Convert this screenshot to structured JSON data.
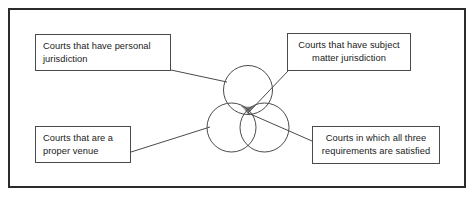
{
  "figure": {
    "frame": {
      "border_color": "#2b2b2b",
      "background_color": "#ffffff"
    },
    "venn": {
      "circle_stroke_color": "#4a4a4a",
      "circle_fill": "none",
      "intersection_fill_color": "#808080",
      "circles": [
        {
          "id": "personal-jurisdiction-circle",
          "label": "Courts that have personal jurisdiction",
          "cx": 248,
          "cy": 90,
          "r": 24.5
        },
        {
          "id": "proper-venue-circle",
          "label": "Courts that are a proper venue",
          "cx": 231.5,
          "cy": 127.5,
          "r": 24.5
        },
        {
          "id": "subject-matter-jurisdiction-circle",
          "label": "Courts that have subject matter jurisdiction",
          "cx": 264.5,
          "cy": 127.5,
          "r": 24.5
        }
      ],
      "center_intersection": {
        "id": "all-three-intersection",
        "label": "Courts in which all three requirements are satisfied",
        "shaded": true
      }
    },
    "callouts": [
      {
        "id": "box-personal-jurisdiction",
        "text": "Courts that have personal jurisdiction",
        "align": "left",
        "points_to": "personal-jurisdiction-circle"
      },
      {
        "id": "box-subject-matter-jurisdiction",
        "text": "Courts that have subject matter jurisdiction",
        "align": "center",
        "points_to": "subject-matter-jurisdiction-circle"
      },
      {
        "id": "box-proper-venue",
        "text": "Courts that are a proper venue",
        "align": "left",
        "points_to": "proper-venue-circle"
      },
      {
        "id": "box-all-three",
        "text": "Courts in which all three requirements are satisfied",
        "align": "center",
        "points_to": "all-three-intersection"
      }
    ],
    "connectors": [
      {
        "id": "connector-personal-jurisdiction",
        "from": "box-personal-jurisdiction",
        "to": "personal-jurisdiction-circle",
        "color": "#4a4a4a"
      },
      {
        "id": "connector-subject-matter-jurisdiction",
        "from": "box-subject-matter-jurisdiction",
        "to": "subject-matter-jurisdiction-circle",
        "color": "#4a4a4a"
      },
      {
        "id": "connector-proper-venue",
        "from": "box-proper-venue",
        "to": "proper-venue-circle",
        "color": "#4a4a4a"
      },
      {
        "id": "connector-all-three",
        "from": "box-all-three",
        "to": "all-three-intersection",
        "color": "#4a4a4a"
      }
    ]
  }
}
